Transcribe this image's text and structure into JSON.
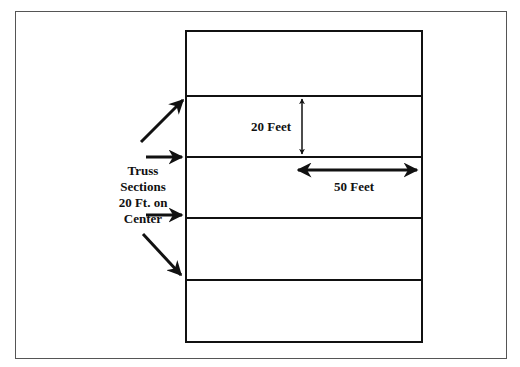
{
  "diagram": {
    "type": "roof truss layout plan",
    "truss_label_lines": [
      "Truss",
      "Sections",
      "20 Ft. on",
      "Center"
    ],
    "dimension_spacing": "20 Feet",
    "dimension_span": "50 Feet",
    "truss_count_shown": 4,
    "colors": {
      "line": "#111111",
      "frame": "#555555",
      "background": "#ffffff"
    }
  }
}
